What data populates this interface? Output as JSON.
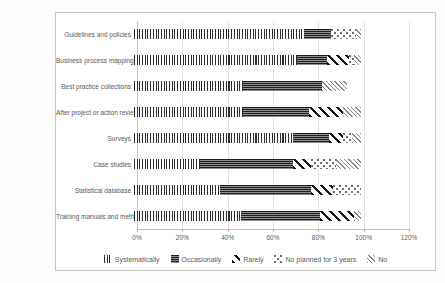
{
  "figure": {
    "background_color": "#fcfcfb",
    "frame_border_color": "#c8c7c4",
    "gridline_color": "#e4e3e1",
    "label_color": "#595959",
    "ink_color": "#1e1e1e"
  },
  "chart_data": {
    "type": "bar",
    "orientation": "horizontal",
    "stacked": true,
    "title": "",
    "categories": [
      "Guidelines and policies",
      "Business process mapping",
      "Best practice collections",
      "After project or action review",
      "Surveys",
      "Case studies",
      "Statistical database",
      "Training manuals and methodologies"
    ],
    "series": [
      {
        "name": "Systematically",
        "pattern": "vertical-lines",
        "values": [
          75,
          72,
          48,
          48,
          70,
          29,
          38,
          47
        ]
      },
      {
        "name": "Occasionally",
        "pattern": "dark-horizontal-lines",
        "values": [
          12,
          13,
          35,
          29,
          16,
          41,
          40,
          35
        ]
      },
      {
        "name": "Rarely",
        "pattern": "bold-diagonal-stripes",
        "values": [
          0,
          10,
          0,
          15,
          6,
          8,
          10,
          15
        ]
      },
      {
        "name": "No planned for 3 years",
        "pattern": "sparse-dots",
        "values": [
          11,
          2,
          0,
          0,
          4,
          11,
          12,
          0
        ]
      },
      {
        "name": "No",
        "pattern": "fine-diagonal-crosshatch",
        "values": [
          2,
          3,
          11,
          8,
          4,
          11,
          0,
          3
        ]
      }
    ],
    "x_axis": {
      "min": 0,
      "max": 120,
      "step": 20,
      "unit": "%",
      "tick_labels": [
        "0%",
        "20%",
        "40%",
        "60%",
        "80%",
        "100%",
        "120%"
      ]
    },
    "grid": true,
    "legend_position": "bottom"
  }
}
